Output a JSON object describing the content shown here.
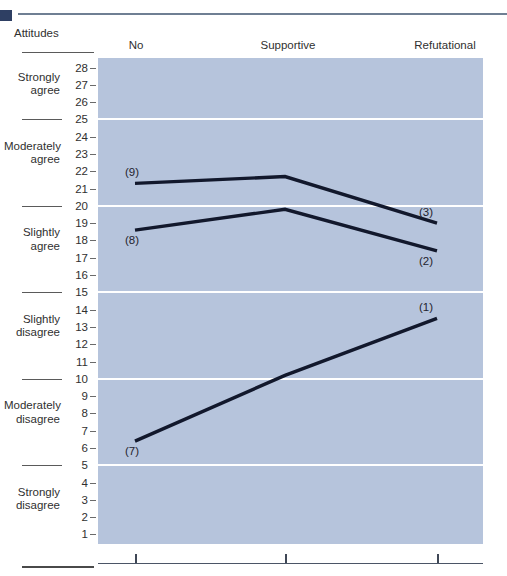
{
  "header": {
    "row_label": "Attitudes",
    "columns": [
      {
        "line1": "No",
        "line2": "inoculation"
      },
      {
        "line1": "Supportive",
        "line2": "inoculation"
      },
      {
        "line1": "Refutational",
        "line2": "inoculation"
      }
    ]
  },
  "axis": {
    "categories": [
      {
        "line1": "Strongly",
        "line2": "agree"
      },
      {
        "line1": "Moderately",
        "line2": "agree"
      },
      {
        "line1": "Slightly",
        "line2": "agree"
      },
      {
        "line1": "Slightly",
        "line2": "disagree"
      },
      {
        "line1": "Moderately",
        "line2": "disagree"
      },
      {
        "line1": "Strongly",
        "line2": "disagree"
      }
    ],
    "ticks": [
      28,
      27,
      26,
      25,
      24,
      23,
      22,
      21,
      20,
      19,
      18,
      17,
      16,
      15,
      14,
      13,
      12,
      11,
      10,
      9,
      8,
      7,
      6,
      5,
      4,
      3,
      2,
      1
    ],
    "major_ticks": [
      25,
      20,
      15,
      10,
      5
    ]
  },
  "colors": {
    "plot_background": "#b6c4dc",
    "gridline": "#ffffff",
    "line": "#12182c",
    "text": "#303030",
    "top_rule": "#6f7f93",
    "top_square": "#2e3f63"
  },
  "chart_data": {
    "type": "line",
    "title": "",
    "xlabel": "",
    "ylabel": "Attitudes",
    "categories": [
      "No inoculation",
      "Supportive inoculation",
      "Refutational inoculation"
    ],
    "ylim": [
      0.5,
      28.5
    ],
    "grid": true,
    "legend": "none",
    "yticklabels": [
      28,
      27,
      26,
      25,
      24,
      23,
      22,
      21,
      20,
      19,
      18,
      17,
      16,
      15,
      14,
      13,
      12,
      11,
      10,
      9,
      8,
      7,
      6,
      5,
      4,
      3,
      2,
      1
    ],
    "ytick_category_bands": [
      {
        "label": "Strongly agree",
        "range": [
          26,
          28
        ]
      },
      {
        "label": "Moderately agree",
        "range": [
          21,
          25
        ]
      },
      {
        "label": "Slightly agree",
        "range": [
          16,
          20
        ]
      },
      {
        "label": "Slightly disagree",
        "range": [
          11,
          15
        ]
      },
      {
        "label": "Moderately disagree",
        "range": [
          6,
          10
        ]
      },
      {
        "label": "Strongly disagree",
        "range": [
          1,
          5
        ]
      }
    ],
    "series": [
      {
        "name": "(9)",
        "start_label": "(9)",
        "end_label": "(3)",
        "values": [
          21.3,
          21.7,
          19.0
        ]
      },
      {
        "name": "(8)",
        "start_label": "(8)",
        "end_label": "(2)",
        "values": [
          18.6,
          19.8,
          17.4
        ]
      },
      {
        "name": "(7)",
        "start_label": "(7)",
        "end_label": "(1)",
        "values": [
          6.4,
          10.2,
          13.5
        ]
      }
    ],
    "annotations": [
      {
        "text": "(9)",
        "x_index": 0,
        "value": 21.3,
        "position": "above-left"
      },
      {
        "text": "(8)",
        "x_index": 0,
        "value": 18.6,
        "position": "below-left"
      },
      {
        "text": "(7)",
        "x_index": 0,
        "value": 6.4,
        "position": "below-left"
      },
      {
        "text": "(3)",
        "x_index": 2,
        "value": 19.0,
        "position": "above-right"
      },
      {
        "text": "(2)",
        "x_index": 2,
        "value": 17.4,
        "position": "below-right"
      },
      {
        "text": "(1)",
        "x_index": 2,
        "value": 13.5,
        "position": "above-right"
      }
    ]
  }
}
